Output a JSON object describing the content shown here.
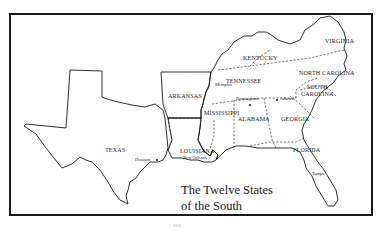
{
  "map": {
    "title_line1": "The Twelve States",
    "title_line2": "of the South",
    "states": {
      "virginia": "VIRGINIA",
      "kentucky": "KENTUCKY",
      "north_carolina": "NORTH CAROLINA",
      "tennessee": "TENNESSEE",
      "south_carolina_1": "SOUTH",
      "south_carolina_2": "CAROLINA",
      "arkansas": "ARKANSAS",
      "mississippi": "MISSISSIPPI",
      "alabama": "ALABAMA",
      "georgia": "GEORGIA",
      "louisiana": "LOUISIANA",
      "florida": "FLORIDA",
      "texas": "TEXAS"
    },
    "cities": {
      "memphis": "Memphis",
      "birmingham": "Birmingham",
      "atlanta": "Atlanta",
      "houston": "Houston",
      "new_orleans": "New Orleans",
      "tampa": "Tampa"
    },
    "colors": {
      "ink": "#1a1a1a",
      "paper": "#ffffff"
    }
  }
}
